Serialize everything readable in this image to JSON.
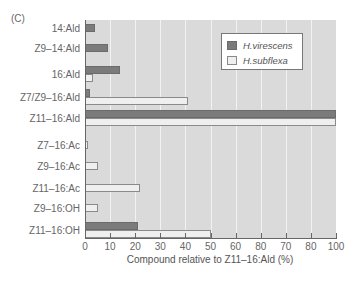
{
  "panel_label": "(C)",
  "chart_data": {
    "type": "bar",
    "orientation": "horizontal",
    "title": "",
    "xlabel": "Compound relative to Z11–16:Ald (%)",
    "ylabel": "",
    "xlim": [
      0,
      100
    ],
    "x_tick_labels": [
      "0",
      "10",
      "20",
      "30",
      "40",
      "50",
      "60",
      "80",
      "70",
      "80",
      "100"
    ],
    "categories": [
      "14:Ald",
      "Z9–14:Ald",
      "16:Ald",
      "Z7/Z9–16:Ald",
      "Z11–16:Ald",
      "Z7–16:Ac",
      "Z9–16:Ac",
      "Z11–16:Ac",
      "Z9–16:OH",
      "Z11–16:OH"
    ],
    "series": [
      {
        "name": "H.virescens",
        "color": "#7b7b7b",
        "values": [
          4,
          9,
          14,
          2,
          100,
          0,
          0,
          0,
          0,
          21
        ]
      },
      {
        "name": "H.subflexa",
        "color": "#efefef",
        "values": [
          0,
          0,
          3,
          41,
          100,
          1,
          5,
          22,
          5,
          50
        ]
      }
    ],
    "grid": true,
    "legend_position": "upper right"
  },
  "legend": {
    "items": [
      {
        "label": "H.virescens"
      },
      {
        "label": "H.subflexa"
      }
    ]
  }
}
